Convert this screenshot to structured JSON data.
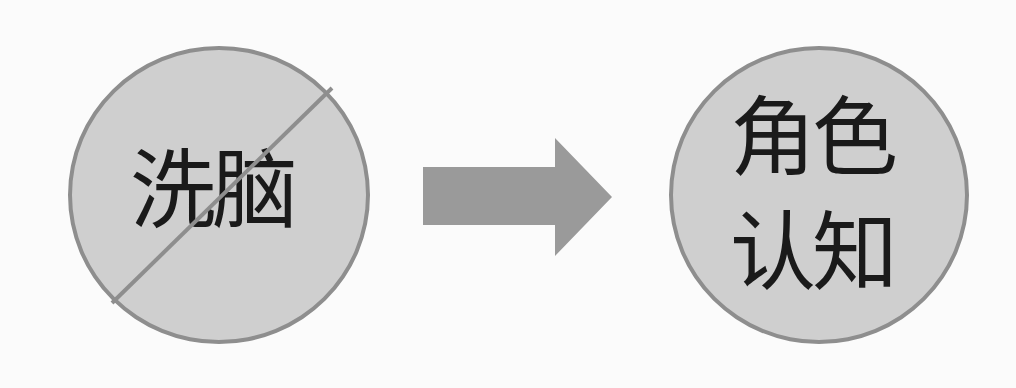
{
  "diagram": {
    "left_node": {
      "label": "洗脑",
      "crossed_out": true,
      "fill": "#cfcfcf",
      "stroke": "#8e8e8e"
    },
    "arrow": {
      "direction": "right",
      "fill": "#9a9a9a"
    },
    "right_node": {
      "line1": "角色",
      "line2": "认知",
      "fill": "#cfcfcf",
      "stroke": "#8e8e8e"
    }
  }
}
